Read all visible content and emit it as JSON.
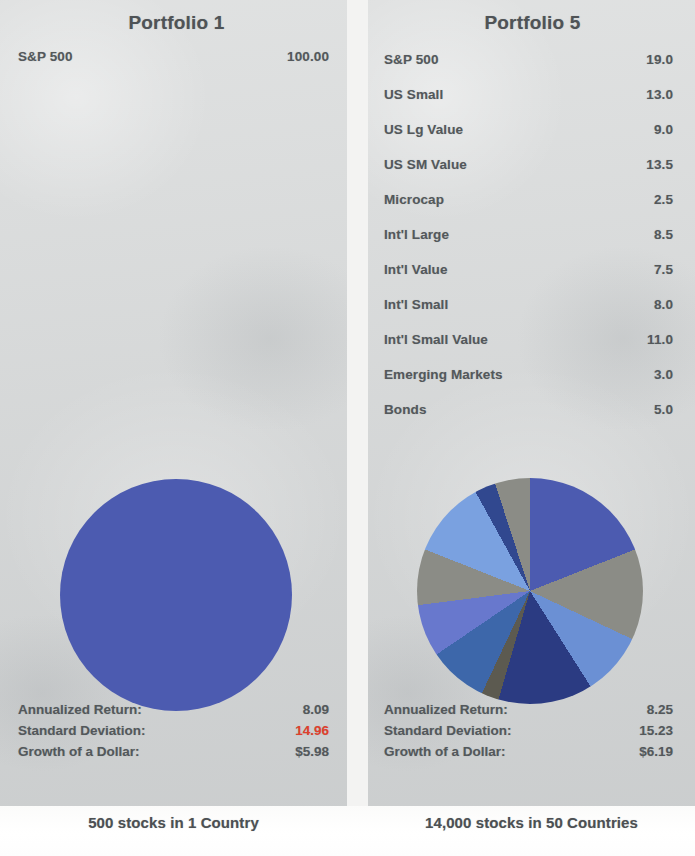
{
  "chart_data": [
    {
      "type": "pie",
      "title": "Portfolio 1",
      "caption": "500 stocks in 1 Country",
      "categories": [
        "S&P 500"
      ],
      "values": [
        100.0
      ],
      "value_labels": [
        "100.00"
      ],
      "colors": [
        "#4c5bb0"
      ],
      "legend": "list-above",
      "stats": [
        {
          "label": "Annualized Return:",
          "value": "8.09",
          "highlight": false
        },
        {
          "label": "Standard Deviation:",
          "value": "14.96",
          "highlight": true
        },
        {
          "label": "Growth of a Dollar:",
          "value": "$5.98",
          "highlight": false
        }
      ]
    },
    {
      "type": "pie",
      "title": "Portfolio 5",
      "caption": "14,000 stocks in 50 Countries",
      "categories": [
        "S&P 500",
        "US Small",
        "US Lg Value",
        "US SM Value",
        "Microcap",
        "Int'l Large",
        "Int'l Value",
        "Int'l Small",
        "Int'l Small Value",
        "Emerging Markets",
        "Bonds"
      ],
      "values": [
        19.0,
        13.0,
        9.0,
        13.5,
        2.5,
        8.5,
        7.5,
        8.0,
        11.0,
        3.0,
        5.0
      ],
      "value_labels": [
        "19.0",
        "13.0",
        "9.0",
        "13.5",
        "2.5",
        "8.5",
        "7.5",
        "8.0",
        "11.0",
        "3.0",
        "5.0"
      ],
      "colors": [
        "#4c5bb0",
        "#8b8c86",
        "#6b90d4",
        "#2b3b82",
        "#5c5a50",
        "#3d67aa",
        "#6878cd",
        "#8b8c86",
        "#7aa1e0",
        "#31488f",
        "#8b8c86"
      ],
      "legend": "list-above",
      "stats": [
        {
          "label": "Annualized Return:",
          "value": "8.25",
          "highlight": false
        },
        {
          "label": "Standard Deviation:",
          "value": "15.23",
          "highlight": false
        },
        {
          "label": "Growth of a Dollar:",
          "value": "$6.19",
          "highlight": false
        }
      ]
    }
  ],
  "left": {
    "title": "Portfolio 1",
    "allocations": [
      {
        "name": "S&P 500",
        "value": "100.00"
      }
    ],
    "stats": [
      {
        "label": "Annualized Return:",
        "value": "8.09",
        "highlight": false
      },
      {
        "label": "Standard Deviation:",
        "value": "14.96",
        "highlight": true
      },
      {
        "label": "Growth of a Dollar:",
        "value": "$5.98",
        "highlight": false
      }
    ],
    "caption": "500 stocks in 1 Country"
  },
  "right": {
    "title": "Portfolio 5",
    "allocations": [
      {
        "name": "S&P 500",
        "value": "19.0"
      },
      {
        "name": "US Small",
        "value": "13.0"
      },
      {
        "name": "US Lg Value",
        "value": "9.0"
      },
      {
        "name": "US SM Value",
        "value": "13.5"
      },
      {
        "name": "Microcap",
        "value": "2.5"
      },
      {
        "name": "Int'l Large",
        "value": "8.5"
      },
      {
        "name": "Int'l Value",
        "value": "7.5"
      },
      {
        "name": "Int'l Small",
        "value": "8.0"
      },
      {
        "name": "Int'l Small Value",
        "value": "11.0"
      },
      {
        "name": "Emerging Markets",
        "value": "3.0"
      },
      {
        "name": "Bonds",
        "value": "5.0"
      }
    ],
    "stats": [
      {
        "label": "Annualized Return:",
        "value": "8.25",
        "highlight": false
      },
      {
        "label": "Standard Deviation:",
        "value": "15.23",
        "highlight": false
      },
      {
        "label": "Growth of a Dollar:",
        "value": "$6.19",
        "highlight": false
      }
    ],
    "caption": "14,000 stocks in 50 Countries"
  },
  "colors": {
    "panel_bg": "#d9dbdb",
    "text": "#53585b",
    "highlight": "#e0402c"
  }
}
